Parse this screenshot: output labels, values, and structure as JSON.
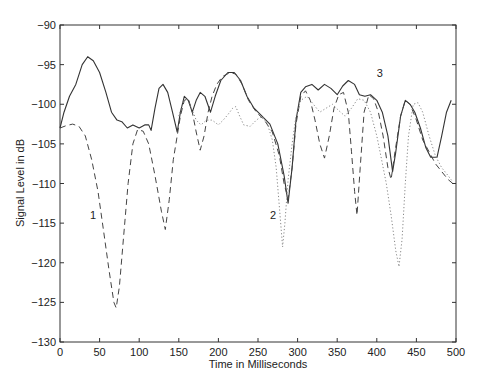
{
  "chart_data": {
    "type": "line",
    "title": "",
    "xlabel": "Time in Milliseconds",
    "ylabel": "Signal Level in dB",
    "xlim": [
      0,
      500
    ],
    "ylim": [
      -130,
      -90
    ],
    "xticks": [
      0,
      50,
      100,
      150,
      200,
      250,
      300,
      350,
      400,
      450,
      500
    ],
    "yticks": [
      -90,
      -95,
      -100,
      -105,
      -110,
      -115,
      -120,
      -125,
      -130
    ],
    "grid": false,
    "legend": "none (curves labeled inline)",
    "annotations": [
      {
        "text": "1",
        "x": 38,
        "y": -114.5
      },
      {
        "text": "2",
        "x": 265,
        "y": -114.5
      },
      {
        "text": "3",
        "x": 400,
        "y": -96.5
      }
    ],
    "series": [
      {
        "name": "3",
        "style": "solid",
        "color": "#333333",
        "points": [
          [
            0,
            -103
          ],
          [
            5,
            -101
          ],
          [
            12,
            -99
          ],
          [
            20,
            -97.5
          ],
          [
            28,
            -95
          ],
          [
            35,
            -94
          ],
          [
            42,
            -94.5
          ],
          [
            50,
            -96
          ],
          [
            58,
            -98.5
          ],
          [
            65,
            -101
          ],
          [
            72,
            -102
          ],
          [
            78,
            -102.2
          ],
          [
            85,
            -103
          ],
          [
            92,
            -102.6
          ],
          [
            100,
            -103
          ],
          [
            107,
            -102.6
          ],
          [
            112,
            -102.6
          ],
          [
            115,
            -103.3
          ],
          [
            120,
            -100.5
          ],
          [
            125,
            -98
          ],
          [
            130,
            -97.5
          ],
          [
            136,
            -98.5
          ],
          [
            142,
            -101
          ],
          [
            148,
            -103.5
          ],
          [
            152,
            -101
          ],
          [
            157,
            -99
          ],
          [
            162,
            -99.5
          ],
          [
            167,
            -101
          ],
          [
            172,
            -99.5
          ],
          [
            177,
            -98.5
          ],
          [
            183,
            -99
          ],
          [
            190,
            -101
          ],
          [
            196,
            -99
          ],
          [
            203,
            -97
          ],
          [
            212,
            -96
          ],
          [
            220,
            -96
          ],
          [
            228,
            -97
          ],
          [
            236,
            -99
          ],
          [
            245,
            -100.5
          ],
          [
            255,
            -101.5
          ],
          [
            265,
            -102.5
          ],
          [
            275,
            -105
          ],
          [
            283,
            -109
          ],
          [
            288,
            -112.5
          ],
          [
            293,
            -108
          ],
          [
            298,
            -102
          ],
          [
            304,
            -98.5
          ],
          [
            310,
            -97.8
          ],
          [
            318,
            -97.5
          ],
          [
            326,
            -98.2
          ],
          [
            334,
            -97.5
          ],
          [
            342,
            -98
          ],
          [
            350,
            -98.8
          ],
          [
            357,
            -97.7
          ],
          [
            364,
            -97
          ],
          [
            372,
            -97.5
          ],
          [
            378,
            -98.8
          ],
          [
            385,
            -99
          ],
          [
            392,
            -98.8
          ],
          [
            400,
            -99.5
          ],
          [
            407,
            -101
          ],
          [
            414,
            -104
          ],
          [
            420,
            -108.5
          ],
          [
            424,
            -106
          ],
          [
            430,
            -101.5
          ],
          [
            436,
            -99.5
          ],
          [
            442,
            -100
          ],
          [
            448,
            -101
          ],
          [
            455,
            -103
          ],
          [
            462,
            -105.5
          ],
          [
            468,
            -106.7
          ],
          [
            476,
            -106.7
          ],
          [
            482,
            -104
          ],
          [
            488,
            -101
          ],
          [
            494,
            -99.5
          ]
        ]
      },
      {
        "name": "1",
        "style": "dashed",
        "color": "#444444",
        "points": [
          [
            0,
            -103
          ],
          [
            8,
            -102.7
          ],
          [
            16,
            -102.5
          ],
          [
            24,
            -102.8
          ],
          [
            32,
            -104
          ],
          [
            40,
            -107
          ],
          [
            48,
            -111
          ],
          [
            55,
            -116
          ],
          [
            62,
            -121
          ],
          [
            68,
            -125
          ],
          [
            71,
            -125.7
          ],
          [
            75,
            -123
          ],
          [
            80,
            -117
          ],
          [
            86,
            -110
          ],
          [
            92,
            -105
          ],
          [
            98,
            -103.2
          ],
          [
            105,
            -103.4
          ],
          [
            112,
            -105
          ],
          [
            120,
            -109
          ],
          [
            128,
            -113.5
          ],
          [
            133,
            -115.8
          ],
          [
            138,
            -112
          ],
          [
            143,
            -107
          ],
          [
            148,
            -104
          ],
          [
            152,
            -101.5
          ],
          [
            157,
            -99.5
          ],
          [
            162,
            -99.3
          ],
          [
            167,
            -101
          ],
          [
            172,
            -103.5
          ],
          [
            177,
            -105.8
          ],
          [
            182,
            -104
          ],
          [
            187,
            -101
          ],
          [
            192,
            -99
          ],
          [
            198,
            -97.5
          ],
          [
            205,
            -96.5
          ],
          [
            215,
            -96
          ],
          [
            222,
            -96.2
          ],
          [
            230,
            -97.5
          ],
          [
            238,
            -99.5
          ],
          [
            248,
            -101
          ],
          [
            258,
            -102
          ],
          [
            268,
            -103.5
          ],
          [
            277,
            -106.5
          ],
          [
            283,
            -110
          ],
          [
            288,
            -112
          ],
          [
            293,
            -108
          ],
          [
            298,
            -102.5
          ],
          [
            304,
            -99
          ],
          [
            310,
            -98.3
          ],
          [
            316,
            -99.5
          ],
          [
            322,
            -102
          ],
          [
            328,
            -105
          ],
          [
            334,
            -106.8
          ],
          [
            340,
            -104
          ],
          [
            346,
            -100.5
          ],
          [
            352,
            -98.8
          ],
          [
            358,
            -98.5
          ],
          [
            364,
            -101
          ],
          [
            368,
            -106
          ],
          [
            372,
            -111
          ],
          [
            375,
            -114
          ],
          [
            379,
            -108
          ],
          [
            384,
            -101
          ],
          [
            390,
            -98.8
          ],
          [
            396,
            -99.3
          ],
          [
            402,
            -101
          ],
          [
            408,
            -104
          ],
          [
            414,
            -108
          ],
          [
            418,
            -109.5
          ],
          [
            423,
            -106
          ],
          [
            430,
            -101.5
          ],
          [
            436,
            -99.5
          ],
          [
            442,
            -100
          ],
          [
            450,
            -102
          ],
          [
            458,
            -104.5
          ],
          [
            466,
            -106
          ],
          [
            474,
            -107.5
          ],
          [
            482,
            -108.5
          ],
          [
            490,
            -109.5
          ],
          [
            496,
            -110
          ]
        ]
      },
      {
        "name": "2",
        "style": "dotted",
        "color": "#888888",
        "points": [
          [
            150,
            -101.5
          ],
          [
            155,
            -99.8
          ],
          [
            160,
            -99.3
          ],
          [
            166,
            -100.5
          ],
          [
            172,
            -102
          ],
          [
            178,
            -102.6
          ],
          [
            185,
            -102
          ],
          [
            192,
            -102
          ],
          [
            200,
            -102.6
          ],
          [
            206,
            -102
          ],
          [
            212,
            -101.3
          ],
          [
            218,
            -100.5
          ],
          [
            222,
            -100.3
          ],
          [
            226,
            -101.3
          ],
          [
            232,
            -102.6
          ],
          [
            240,
            -102.8
          ],
          [
            248,
            -102
          ],
          [
            255,
            -101.5
          ],
          [
            262,
            -102.5
          ],
          [
            268,
            -104.5
          ],
          [
            273,
            -108
          ],
          [
            277,
            -113
          ],
          [
            281,
            -118
          ],
          [
            284,
            -115
          ],
          [
            288,
            -109.5
          ],
          [
            293,
            -105
          ],
          [
            298,
            -101.5
          ],
          [
            304,
            -99.5
          ],
          [
            312,
            -99
          ],
          [
            320,
            -100
          ],
          [
            328,
            -101
          ],
          [
            336,
            -100.5
          ],
          [
            344,
            -100
          ],
          [
            352,
            -100.8
          ],
          [
            360,
            -101.5
          ],
          [
            368,
            -100.5
          ],
          [
            376,
            -99.3
          ],
          [
            384,
            -99.5
          ],
          [
            392,
            -101
          ],
          [
            400,
            -104
          ],
          [
            406,
            -107
          ],
          [
            412,
            -110
          ],
          [
            418,
            -114
          ],
          [
            424,
            -118.5
          ],
          [
            428,
            -120.5
          ],
          [
            432,
            -117
          ],
          [
            436,
            -110
          ],
          [
            440,
            -104
          ],
          [
            446,
            -100
          ],
          [
            452,
            -99.8
          ],
          [
            458,
            -101
          ],
          [
            466,
            -104
          ],
          [
            474,
            -106.5
          ],
          [
            482,
            -108
          ],
          [
            490,
            -109
          ],
          [
            496,
            -109.8
          ]
        ]
      }
    ]
  }
}
